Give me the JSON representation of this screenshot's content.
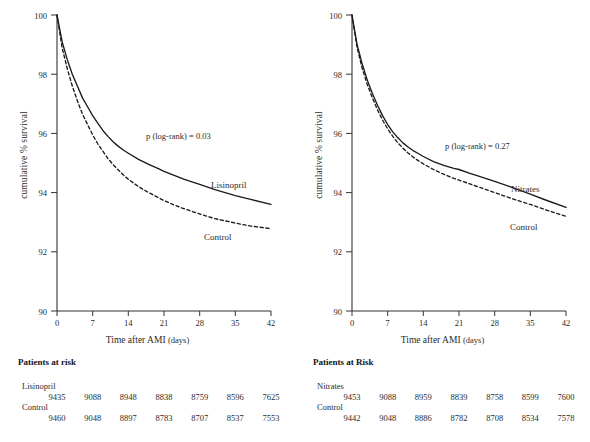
{
  "figure": {
    "panels": [
      {
        "id": "lisinopril",
        "ylabel": "cumulative % survival",
        "xlabel_main": "Time after AMI",
        "xlabel_unit": "(days)",
        "pvalue_text": "p (log-rank) = 0.03",
        "treatment_label": "Lisinopril",
        "control_label": "Control",
        "risk_title": "Patients at risk",
        "risk_rows": [
          {
            "group": "Lisinopril",
            "values": [
              "9435",
              "9088",
              "8948",
              "8838",
              "8759",
              "8596",
              "7625"
            ]
          },
          {
            "group": "Control",
            "values": [
              "9460",
              "9048",
              "8897",
              "8783",
              "8707",
              "8537",
              "7553"
            ]
          }
        ]
      },
      {
        "id": "nitrates",
        "ylabel": "cumulative % survival",
        "xlabel_main": "Time after AMI",
        "xlabel_unit": "(days)",
        "pvalue_text": "p (log-rank) = 0.27",
        "treatment_label": "Nitrates",
        "control_label": "Control",
        "risk_title": "Patients at Risk",
        "risk_rows": [
          {
            "group": "Nitrates",
            "values": [
              "9453",
              "9088",
              "8959",
              "8839",
              "8758",
              "8599",
              "7600"
            ]
          },
          {
            "group": "Control",
            "values": [
              "9442",
              "9048",
              "8886",
              "8782",
              "8708",
              "8534",
              "7578"
            ]
          }
        ]
      }
    ],
    "y_ticks": [
      "100",
      "98",
      "96",
      "94",
      "92",
      "90"
    ],
    "x_ticks": [
      "0",
      "7",
      "14",
      "21",
      "28",
      "35",
      "42"
    ]
  },
  "chart_data": [
    {
      "type": "line",
      "title": "Lisinopril vs Control cumulative survival after AMI",
      "xlabel": "Time after AMI (days)",
      "ylabel": "cumulative % survival",
      "xlim": [
        0,
        42
      ],
      "ylim": [
        90,
        100
      ],
      "xticks": [
        0,
        7,
        14,
        21,
        28,
        35,
        42
      ],
      "yticks": [
        90,
        92,
        94,
        96,
        98,
        100
      ],
      "grid": false,
      "legend": "inline-curve-labels",
      "annotations": [
        "p (log-rank) = 0.03"
      ],
      "series": [
        {
          "name": "Lisinopril",
          "style": "solid",
          "x": [
            0,
            1,
            2,
            3,
            4,
            5,
            6,
            7,
            8,
            9,
            10,
            11,
            12,
            13,
            14,
            16,
            18,
            20,
            21,
            23,
            25,
            28,
            31,
            35,
            38,
            42
          ],
          "y": [
            100.0,
            99.1,
            98.5,
            98.0,
            97.6,
            97.2,
            96.9,
            96.6,
            96.35,
            96.1,
            95.9,
            95.72,
            95.57,
            95.44,
            95.33,
            95.12,
            94.95,
            94.8,
            94.72,
            94.58,
            94.45,
            94.28,
            94.1,
            93.9,
            93.77,
            93.6
          ]
        },
        {
          "name": "Control",
          "style": "dashed",
          "x": [
            0,
            1,
            2,
            3,
            4,
            5,
            6,
            7,
            8,
            9,
            10,
            11,
            12,
            13,
            14,
            16,
            18,
            20,
            21,
            23,
            25,
            28,
            31,
            35,
            38,
            42
          ],
          "y": [
            100.0,
            98.9,
            98.2,
            97.6,
            97.1,
            96.65,
            96.3,
            95.95,
            95.65,
            95.4,
            95.15,
            94.95,
            94.77,
            94.6,
            94.45,
            94.2,
            94.0,
            93.82,
            93.73,
            93.58,
            93.45,
            93.28,
            93.12,
            92.97,
            92.87,
            92.78
          ]
        }
      ],
      "risk_table": {
        "times": [
          0,
          7,
          14,
          21,
          28,
          35,
          42
        ],
        "title": "Patients at risk",
        "rows": [
          {
            "group": "Lisinopril",
            "counts": [
              9435,
              9088,
              8948,
              8838,
              8759,
              8596,
              7625
            ]
          },
          {
            "group": "Control",
            "counts": [
              9460,
              9048,
              8897,
              8783,
              8707,
              8537,
              7553
            ]
          }
        ]
      }
    },
    {
      "type": "line",
      "title": "Nitrates vs Control cumulative survival after AMI",
      "xlabel": "Time after AMI (days)",
      "ylabel": "cumulative % survival",
      "xlim": [
        0,
        42
      ],
      "ylim": [
        90,
        100
      ],
      "xticks": [
        0,
        7,
        14,
        21,
        28,
        35,
        42
      ],
      "yticks": [
        90,
        92,
        94,
        96,
        98,
        100
      ],
      "grid": false,
      "legend": "inline-curve-labels",
      "annotations": [
        "p (log-rank) = 0.27"
      ],
      "series": [
        {
          "name": "Nitrates",
          "style": "solid",
          "x": [
            0,
            1,
            2,
            3,
            4,
            5,
            6,
            7,
            8,
            9,
            10,
            11,
            12,
            13,
            14,
            16,
            18,
            20,
            21,
            23,
            25,
            28,
            31,
            35,
            38,
            42
          ],
          "y": [
            100.0,
            99.0,
            98.35,
            97.8,
            97.35,
            96.95,
            96.6,
            96.3,
            96.05,
            95.85,
            95.68,
            95.54,
            95.42,
            95.32,
            95.22,
            95.05,
            94.92,
            94.82,
            94.78,
            94.66,
            94.55,
            94.38,
            94.2,
            93.95,
            93.75,
            93.5
          ]
        },
        {
          "name": "Control",
          "style": "dashed",
          "x": [
            0,
            1,
            2,
            3,
            4,
            5,
            6,
            7,
            8,
            9,
            10,
            11,
            12,
            13,
            14,
            16,
            18,
            20,
            21,
            23,
            25,
            28,
            31,
            35,
            38,
            42
          ],
          "y": [
            100.0,
            98.9,
            98.2,
            97.65,
            97.2,
            96.8,
            96.45,
            96.15,
            95.9,
            95.68,
            95.5,
            95.34,
            95.2,
            95.08,
            94.97,
            94.78,
            94.62,
            94.48,
            94.42,
            94.3,
            94.18,
            94.0,
            93.82,
            93.6,
            93.42,
            93.2
          ]
        }
      ],
      "risk_table": {
        "times": [
          0,
          7,
          14,
          21,
          28,
          35,
          42
        ],
        "title": "Patients at Risk",
        "rows": [
          {
            "group": "Nitrates",
            "counts": [
              9453,
              9088,
              8959,
              8839,
              8758,
              8599,
              7600
            ]
          },
          {
            "group": "Control",
            "counts": [
              9442,
              9048,
              8886,
              8782,
              8708,
              8534,
              7578
            ]
          }
        ]
      }
    }
  ]
}
